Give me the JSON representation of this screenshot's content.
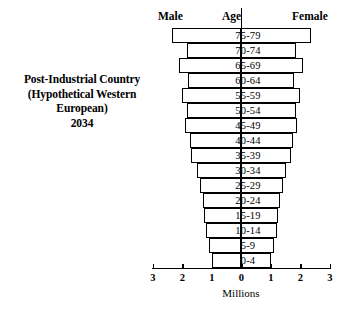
{
  "caption": {
    "lines": [
      "Post-Industrial Country",
      "(Hypothetical Western",
      "European)",
      "2034"
    ]
  },
  "headers": {
    "male": "Male",
    "age": "Age",
    "female": "Female"
  },
  "axis": {
    "title": "Millions",
    "tick_labels": [
      "3",
      "2",
      "1",
      "0",
      "1",
      "2",
      "3"
    ]
  },
  "chart_data": {
    "type": "bar",
    "subtype": "population-pyramid",
    "title": "Post-Industrial Country (Hypothetical Western European) 2034",
    "xlabel": "Millions",
    "ylabel": "Age",
    "xlim": [
      -3,
      3
    ],
    "xticks": [
      -3,
      -2,
      -1,
      0,
      1,
      2,
      3
    ],
    "xtick_labels": [
      "3",
      "2",
      "1",
      "0",
      "1",
      "2",
      "3"
    ],
    "grid": false,
    "legend": [
      "Male",
      "Female"
    ],
    "legend_position": "top",
    "orientation": "horizontal",
    "categories": [
      "75-79",
      "70-74",
      "65-69",
      "60-64",
      "55-59",
      "50-54",
      "45-49",
      "40-44",
      "35-39",
      "30-34",
      "25-29",
      "20-24",
      "15-19",
      "10-14",
      "5-9",
      "0-4"
    ],
    "series": [
      {
        "name": "Male",
        "side": "left",
        "values": [
          2.35,
          1.85,
          2.1,
          1.8,
          2.0,
          1.85,
          1.9,
          1.75,
          1.7,
          1.5,
          1.4,
          1.3,
          1.25,
          1.2,
          1.1,
          1.0
        ]
      },
      {
        "name": "Female",
        "side": "right",
        "values": [
          2.35,
          1.85,
          2.1,
          1.8,
          2.0,
          1.85,
          1.9,
          1.75,
          1.7,
          1.5,
          1.4,
          1.3,
          1.25,
          1.2,
          1.1,
          1.0
        ]
      }
    ]
  }
}
